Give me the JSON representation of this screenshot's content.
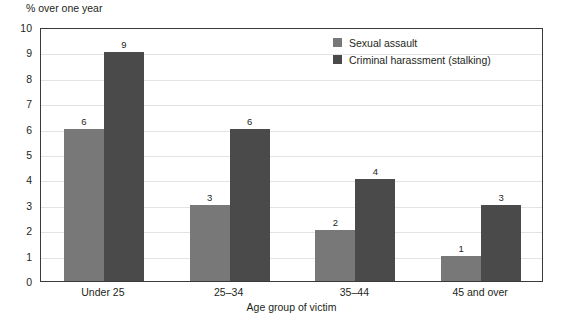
{
  "chart_data": {
    "type": "bar",
    "title": "",
    "unit_label": "% over one year",
    "xlabel": "Age group of victim",
    "ylabel": "",
    "categories": [
      "Under 25",
      "25–34",
      "35–44",
      "45 and over"
    ],
    "series": [
      {
        "name": "Sexual assault",
        "color": "#787878",
        "values": [
          6,
          3,
          2,
          1
        ]
      },
      {
        "name": "Criminal harassment (stalking)",
        "color": "#4a4a4a",
        "values": [
          9,
          6,
          4,
          3
        ]
      }
    ],
    "ylim": [
      0,
      10
    ],
    "ytick_step": 1,
    "yticks": [
      10,
      9,
      8,
      7,
      6,
      5,
      4,
      3,
      2,
      1,
      0
    ],
    "ytick_labels": [
      "10",
      "9",
      "8",
      "7",
      "6",
      "5",
      "4",
      "3",
      "2",
      "1",
      "0"
    ],
    "grid": true,
    "grid_axis": "y",
    "grid_color": "#e3e3e3",
    "legend_position": "top-right",
    "data_labels": true,
    "frame_color": "#3a3a3a",
    "background_color": "#ffffff"
  }
}
